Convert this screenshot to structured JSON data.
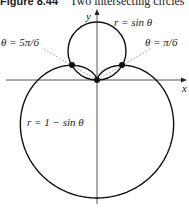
{
  "figure": {
    "number": "Figure 8.44",
    "title": "Two intersecting circles"
  },
  "labels": {
    "y_axis": "y",
    "x_axis": "x",
    "curve_small": "r = sin θ",
    "curve_large": "r = 1 − sin θ",
    "point_left": "θ = 5π/6",
    "point_right": "θ = π/6"
  },
  "chart_data": {
    "type": "line",
    "title": "Two intersecting circles",
    "xlabel": "x",
    "ylabel": "y",
    "series": [
      {
        "name": "r = sin θ",
        "kind": "polar"
      },
      {
        "name": "r = 1 − sin θ",
        "kind": "polar"
      }
    ],
    "intersections": [
      {
        "theta": "π/6",
        "x": 0.433,
        "y": 0.25
      },
      {
        "theta": "5π/6",
        "x": -0.433,
        "y": 0.25
      },
      {
        "theta": "origin",
        "x": 0,
        "y": 0
      }
    ],
    "grid": false
  }
}
